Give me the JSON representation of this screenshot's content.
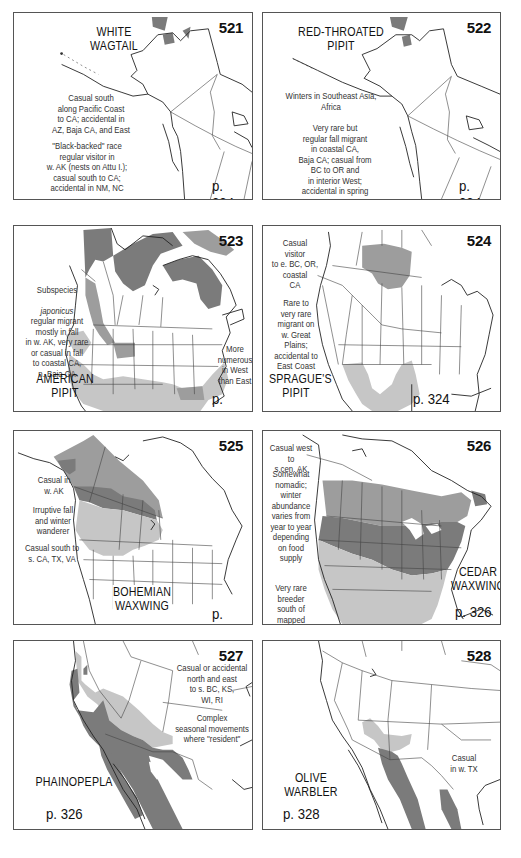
{
  "page": {
    "type": "field-guide range maps",
    "colors": {
      "range_dark": "#7b7b7b",
      "range_medium": "#9d9d9d",
      "range_light": "#c6c6c6",
      "border": "#555555",
      "text": "#111111"
    }
  },
  "maps": [
    {
      "number": "521",
      "species_line1": "WHITE",
      "species_line2": "WAGTAIL",
      "notes": [
        "Casual south\nalong Pacific Coast\nto CA; accidental in\nAZ, Baja CA, and East",
        "\"Black-backed\" race\nregular visitor in\nw. AK (nests on Attu I.);\ncasual south to CA;\naccidental in NM, NC"
      ],
      "page_ref": "p. 324"
    },
    {
      "number": "522",
      "species_line1": "RED-THROATED",
      "species_line2": "PIPIT",
      "notes": [
        "Winters in Southeast Asia,\nAfrica",
        "Very rare but\nregular fall migrant\nin coastal CA,\nBaja CA; casual from\nBC to OR and\nin interior West;\naccidental in spring"
      ],
      "page_ref": "p. 324"
    },
    {
      "number": "523",
      "species_line1": "AMERICAN",
      "species_line2": "PIPIT",
      "notes": [
        "Subspecies",
        "japonicus",
        "regular migrant\nmostly in fall\nin w. AK, very rare\nor casual in fall\nto coastal CA,\nn. Baja CA",
        "More\nnumerous\nin West\nthan East"
      ],
      "page_ref": "p. 324"
    },
    {
      "number": "524",
      "species_line1": "SPRAGUE'S",
      "species_line2": "PIPIT",
      "notes": [
        "Casual\nvisitor\nto e. BC, OR,\ncoastal\nCA",
        "Rare to\nvery rare\nmigrant on\nw. Great Plains;\naccidental to\nEast Coast"
      ],
      "page_ref": "p. 324"
    },
    {
      "number": "525",
      "species_line1": "BOHEMIAN",
      "species_line2": "WAXWING",
      "notes": [
        "Casual in\nw. AK",
        "Irruptive fall\nand winter\nwanderer",
        "Casual south to\ns. CA, TX, VA"
      ],
      "page_ref": "p. 326"
    },
    {
      "number": "526",
      "species_line1": "CEDAR",
      "species_line2": "WAXWING",
      "notes": [
        "Casual west to\ns.cen. AK",
        "Somewhat\nnomadic;\nwinter\nabundance\nvaries from\nyear to year\ndepending\non food\nsupply",
        "Very rare\nbreeder\nsouth of\nmapped range"
      ],
      "page_ref": "p. 326"
    },
    {
      "number": "527",
      "species_line1": "PHAINOPEPLA",
      "species_line2": "",
      "notes": [
        "Casual or accidental\nnorth and east\nto s. BC, KS,\nWI, RI",
        "Complex\nseasonal movements\nwhere \"resident\""
      ],
      "page_ref": "p. 326"
    },
    {
      "number": "528",
      "species_line1": "OLIVE",
      "species_line2": "WARBLER",
      "notes": [
        "Casual\nin w. TX"
      ],
      "page_ref": "p. 328"
    }
  ]
}
